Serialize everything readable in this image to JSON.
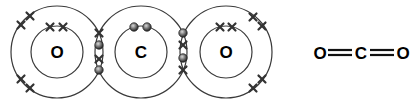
{
  "diagram": {
    "atoms": [
      {
        "symbol": "O",
        "cx": 57,
        "cy": 52
      },
      {
        "symbol": "C",
        "cx": 141,
        "cy": 52
      },
      {
        "symbol": "O",
        "cx": 226,
        "cy": 52
      }
    ],
    "structural_formula": {
      "left": "O",
      "center": "C",
      "right": "O",
      "bond": "double"
    },
    "legend": {
      "cross": "oxygen electron",
      "dot": "carbon electron"
    },
    "colors": {
      "line": "#3a3a3a",
      "text": "#000000",
      "dot": "#6a6a6a"
    }
  }
}
